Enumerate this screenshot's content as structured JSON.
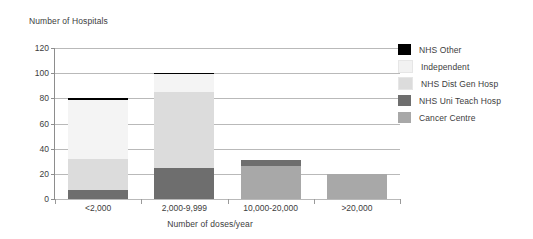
{
  "chart_data": {
    "type": "bar",
    "subtype": "stacked",
    "title": "",
    "ylabel": "Number of Hospitals",
    "xlabel": "Number of doses/year",
    "ylim": [
      0,
      120
    ],
    "yticks": [
      0,
      20,
      40,
      60,
      80,
      100,
      120
    ],
    "grid": true,
    "legend_position": "right",
    "categories": [
      "<2,000",
      "2,000-9,999",
      "10,000-20,000",
      ">20,000"
    ],
    "series": [
      {
        "name": "Cancer Centre",
        "color": "#a8a8a8",
        "values": [
          0,
          0,
          26,
          20
        ]
      },
      {
        "name": "NHS Uni Teach Hosp",
        "color": "#6e6e6e",
        "values": [
          7,
          25,
          5,
          0
        ]
      },
      {
        "name": "NHS Dist Gen Hosp",
        "color": "#dcdcdc",
        "values": [
          25,
          60,
          0,
          0
        ]
      },
      {
        "name": "Independent",
        "color": "#f2f2f2",
        "values": [
          47,
          14,
          0,
          0
        ]
      },
      {
        "name": "NHS Other",
        "color": "#000000",
        "values": [
          1,
          1,
          0,
          0
        ]
      }
    ],
    "totals": [
      80,
      100,
      31,
      20
    ]
  },
  "axes": {
    "y_title": "Number of Hospitals",
    "x_title": "Number of doses/year",
    "y_ticks": [
      "120",
      "100",
      "80",
      "60",
      "40",
      "20",
      "0"
    ],
    "x_labels": [
      "<2,000",
      "2,000-9,999",
      "10,000-20,000",
      ">20,000"
    ]
  },
  "legend": {
    "items": [
      {
        "label": "NHS Other",
        "color": "#000000"
      },
      {
        "label": "Independent",
        "color": "#f2f2f2"
      },
      {
        "label": "NHS Dist Gen Hosp",
        "color": "#dcdcdc"
      },
      {
        "label": "NHS Uni Teach Hosp",
        "color": "#6e6e6e"
      },
      {
        "label": "Cancer Centre",
        "color": "#a8a8a8"
      }
    ]
  },
  "colors": {
    "grid": "#b9b9b9",
    "axis": "#8d8d8d",
    "text": "#3d3d3d",
    "background": "#ffffff"
  }
}
